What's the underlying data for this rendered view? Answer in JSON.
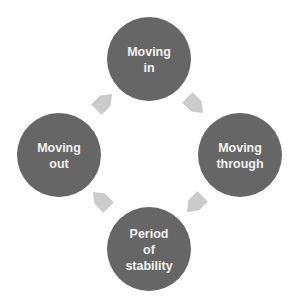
{
  "diagram": {
    "type": "cycle",
    "colors": {
      "node_fill": "#666666",
      "node_text": "#f2f2f2",
      "arrow_fill": "#cbcbcb",
      "background": "#ffffff"
    },
    "nodes": [
      {
        "id": "moving-in",
        "lines": [
          "Moving",
          "in"
        ]
      },
      {
        "id": "moving-through",
        "lines": [
          "Moving",
          "through"
        ]
      },
      {
        "id": "period-of-stability",
        "lines": [
          "Period",
          "of",
          "stability"
        ]
      },
      {
        "id": "moving-out",
        "lines": [
          "Moving",
          "out"
        ]
      }
    ],
    "arrows": [
      {
        "from": "moving-in",
        "to": "moving-through",
        "icon": "arrow-down-right-icon"
      },
      {
        "from": "moving-through",
        "to": "period-of-stability",
        "icon": "arrow-down-left-icon"
      },
      {
        "from": "period-of-stability",
        "to": "moving-out",
        "icon": "arrow-up-left-icon"
      },
      {
        "from": "moving-out",
        "to": "moving-in",
        "icon": "arrow-up-right-icon"
      }
    ]
  }
}
